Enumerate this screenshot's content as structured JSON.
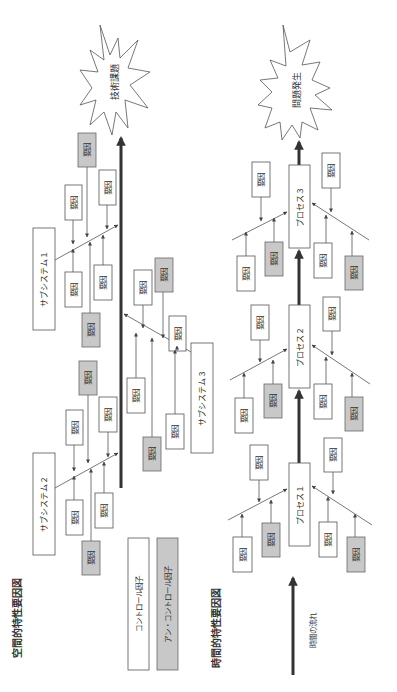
{
  "titles": {
    "spatial": "空間的特性要因図",
    "temporal": "時間的特性要因図"
  },
  "factor_label": "要因",
  "spatial": {
    "effect": "技術課題",
    "subsystems": [
      {
        "label": "サブシステム１"
      },
      {
        "label": "サブシステム２"
      },
      {
        "label": "サブシステム３"
      }
    ]
  },
  "legend": {
    "control": "コントロール因子",
    "uncontrol": "アン・コントロール因子"
  },
  "temporal": {
    "effect": "問題発生",
    "processes": [
      {
        "label": "プロセス１"
      },
      {
        "label": "プロセス２"
      },
      {
        "label": "プロセス３"
      }
    ],
    "time_flow": "時間の流れ"
  },
  "colors": {
    "gray_factor": "#c8c8c8",
    "line": "#555555",
    "spine": "#333333"
  }
}
